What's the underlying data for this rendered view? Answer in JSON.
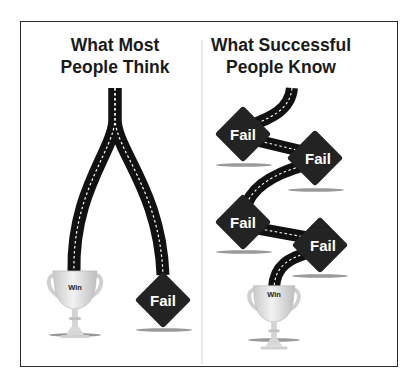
{
  "left_panel": {
    "title_line1": "What Most",
    "title_line2": "People Think",
    "outcomes": [
      {
        "type": "trophy",
        "label": "Win"
      },
      {
        "type": "diamond",
        "label": "Fail"
      }
    ]
  },
  "right_panel": {
    "title_line1": "What Successful",
    "title_line2": "People Know",
    "outcomes": [
      {
        "type": "diamond",
        "label": "Fail"
      },
      {
        "type": "diamond",
        "label": "Fail"
      },
      {
        "type": "diamond",
        "label": "Fail"
      },
      {
        "type": "diamond",
        "label": "Fail"
      },
      {
        "type": "trophy",
        "label": "Win"
      }
    ]
  },
  "colors": {
    "road": "#111111",
    "road_dash": "#ffffff",
    "diamond": "#232323",
    "trophy": "#d9d9d9",
    "shadow": "#9a9a9a",
    "divider": "#d0d0d0",
    "frame": "#2a2a2a"
  }
}
